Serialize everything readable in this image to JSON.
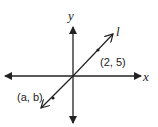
{
  "diagram": {
    "type": "coordinate-plane",
    "axes": {
      "x_label": "x",
      "y_label": "y"
    },
    "line": {
      "label": "l",
      "passes_through_origin": true,
      "points": [
        {
          "label": "(2, 5)",
          "x": 2,
          "y": 5
        },
        {
          "label": "(a, b)",
          "x": "a",
          "y": "b"
        }
      ]
    },
    "colors": {
      "stroke": "#222222",
      "background": "#ffffff"
    }
  }
}
